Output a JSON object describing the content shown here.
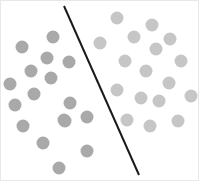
{
  "figure": {
    "name": "two-group-dot-separation",
    "width": 199,
    "height": 181,
    "background_color": "#ffffff",
    "border_color": "#e8e8e8"
  },
  "chart_data": {
    "type": "scatter",
    "title": "",
    "subtitle": "",
    "xlabel": "",
    "ylabel": "",
    "xlim": [
      0,
      199
    ],
    "ylim": [
      0,
      181
    ],
    "grid": false,
    "legend_position": "none",
    "axes_visible": false,
    "tick_labels": [],
    "annotations": [],
    "marker_shape": "circle",
    "marker_diameter": 13,
    "series": [
      {
        "name": "left-group",
        "color": "#a9a9a9",
        "count": 17,
        "points": [
          {
            "x": 21,
            "y": 46
          },
          {
            "x": 52,
            "y": 36
          },
          {
            "x": 9,
            "y": 83
          },
          {
            "x": 30,
            "y": 70
          },
          {
            "x": 50,
            "y": 77
          },
          {
            "x": 68,
            "y": 61
          },
          {
            "x": 33,
            "y": 93
          },
          {
            "x": 69,
            "y": 102
          },
          {
            "x": 22,
            "y": 125
          },
          {
            "x": 64,
            "y": 120
          },
          {
            "x": 86,
            "y": 116
          },
          {
            "x": 42,
            "y": 142
          },
          {
            "x": 58,
            "y": 167
          },
          {
            "x": 86,
            "y": 150
          },
          {
            "x": 63,
            "y": 119
          },
          {
            "x": 46,
            "y": 57
          },
          {
            "x": 14,
            "y": 104
          }
        ]
      },
      {
        "name": "right-group",
        "color": "#c6c6c6",
        "count": 17,
        "points": [
          {
            "x": 116,
            "y": 17
          },
          {
            "x": 151,
            "y": 24
          },
          {
            "x": 99,
            "y": 42
          },
          {
            "x": 133,
            "y": 36
          },
          {
            "x": 155,
            "y": 48
          },
          {
            "x": 124,
            "y": 60
          },
          {
            "x": 180,
            "y": 60
          },
          {
            "x": 145,
            "y": 70
          },
          {
            "x": 116,
            "y": 89
          },
          {
            "x": 168,
            "y": 82
          },
          {
            "x": 190,
            "y": 95
          },
          {
            "x": 158,
            "y": 100
          },
          {
            "x": 177,
            "y": 120
          },
          {
            "x": 149,
            "y": 125
          },
          {
            "x": 126,
            "y": 119
          },
          {
            "x": 140,
            "y": 97
          },
          {
            "x": 169,
            "y": 38
          }
        ]
      }
    ],
    "divider": {
      "name": "separating-line",
      "color": "#1a1a1a",
      "width": 2,
      "x1": 63,
      "y1": 5,
      "x2": 138,
      "y2": 174
    }
  }
}
